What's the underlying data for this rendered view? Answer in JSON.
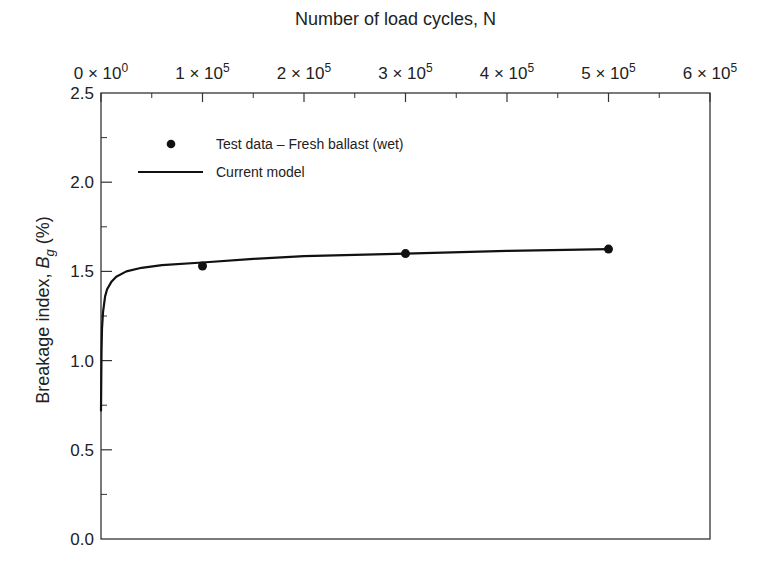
{
  "chart_data": {
    "type": "line",
    "title": "",
    "xlabel": "Number of load cycles, N",
    "ylabel": "Breakage index, B_g (%)",
    "ylabel_parts": {
      "prefix": "Breakage index, ",
      "symbol": "B",
      "subscript": "g",
      "suffix": " (%)"
    },
    "xaxis_position": "top",
    "xlim": [
      0,
      600000
    ],
    "ylim": [
      0.0,
      2.5
    ],
    "grid": false,
    "x_ticks": [
      {
        "value": 0,
        "mantissa": "0",
        "exponent": "0"
      },
      {
        "value": 100000,
        "mantissa": "1",
        "exponent": "5"
      },
      {
        "value": 200000,
        "mantissa": "2",
        "exponent": "5"
      },
      {
        "value": 300000,
        "mantissa": "3",
        "exponent": "5"
      },
      {
        "value": 400000,
        "mantissa": "4",
        "exponent": "5"
      },
      {
        "value": 500000,
        "mantissa": "5",
        "exponent": "5"
      },
      {
        "value": 600000,
        "mantissa": "6",
        "exponent": "5"
      }
    ],
    "x_minor_ticks": [
      50000,
      150000,
      250000,
      350000,
      450000,
      550000
    ],
    "y_ticks": [
      "0.0",
      "0.5",
      "1.0",
      "1.5",
      "2.0",
      "2.5"
    ],
    "y_minor_ticks": [
      0.25,
      0.75,
      1.25,
      1.75,
      2.25
    ],
    "legend_position": "upper left",
    "series": [
      {
        "name": "Test data – Fresh ballast (wet)",
        "style": "scatter",
        "marker": "filled-circle",
        "color": "#111111",
        "x": [
          100000,
          300000,
          500000
        ],
        "y": [
          1.53,
          1.6,
          1.625
        ]
      },
      {
        "name": "Current model",
        "style": "line",
        "color": "#111111",
        "x": [
          0,
          500,
          1000,
          2000,
          4000,
          6000,
          10000,
          15000,
          25000,
          40000,
          60000,
          100000,
          150000,
          200000,
          300000,
          400000,
          500000
        ],
        "y": [
          0.72,
          1.05,
          1.18,
          1.27,
          1.36,
          1.4,
          1.44,
          1.47,
          1.5,
          1.52,
          1.535,
          1.55,
          1.57,
          1.585,
          1.6,
          1.615,
          1.625
        ]
      }
    ]
  },
  "legend": {
    "items": [
      {
        "label": "Test data – Fresh ballast (wet)",
        "symbol": "dot"
      },
      {
        "label": "Current model",
        "symbol": "line"
      }
    ]
  },
  "colors": {
    "ink": "#111111",
    "frame": "#333333",
    "background": "#ffffff"
  }
}
